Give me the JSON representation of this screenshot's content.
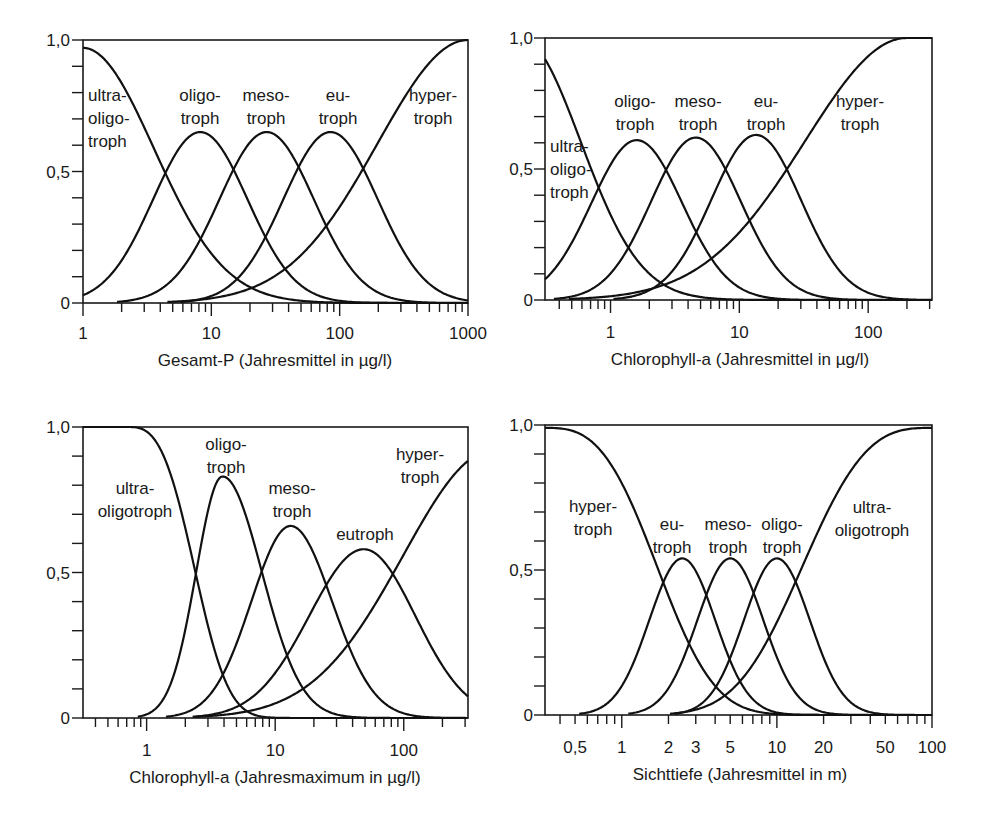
{
  "figure": {
    "colors": {
      "background": "#ffffff",
      "ink": "#111111"
    }
  },
  "chart_data": [
    {
      "id": "tp",
      "type": "line",
      "title": "",
      "xlabel": "Gesamt-P (Jahresmittel in µg/l)",
      "ylabel": "",
      "xscale": "log",
      "xlim": [
        1,
        1000
      ],
      "ylim": [
        0,
        1.0
      ],
      "grid": false,
      "legend": "none (inline labels)",
      "yticks": [
        {
          "v": 0,
          "label": "0"
        },
        {
          "v": 0.5,
          "label": "0,5"
        },
        {
          "v": 1.0,
          "label": "1,0"
        }
      ],
      "xticks": [
        {
          "v": 1,
          "label": "1"
        },
        {
          "v": 10,
          "label": "10"
        },
        {
          "v": 100,
          "label": "100"
        },
        {
          "v": 1000,
          "label": "1000"
        }
      ],
      "layout": {
        "px0": 83,
        "px1": 468,
        "py0": 303,
        "py1": 40,
        "ylab_x": 70,
        "xlab_y": 339,
        "title_x": 275,
        "title_y": 366
      },
      "series": [
        {
          "name": "ultra-oligotroph",
          "peak_x": 1,
          "peak_y": 0.97,
          "cross_half_x": 4.4,
          "model": {
            "mu": 0.0,
            "h": 0.97,
            "wl": 0.65,
            "wr": 0.65,
            "p": 2,
            "clampLeft": true
          }
        },
        {
          "name": "oligotroph",
          "peak_x": 8.2,
          "peak_y": 0.65,
          "model": {
            "mu": 0.914,
            "h": 0.65,
            "wl": 0.433,
            "wr": 0.433,
            "p": 2
          }
        },
        {
          "name": "mesotroph",
          "peak_x": 27,
          "peak_y": 0.65,
          "model": {
            "mu": 1.431,
            "h": 0.65,
            "wl": 0.433,
            "wr": 0.433,
            "p": 2
          }
        },
        {
          "name": "eutroph",
          "peak_x": 85,
          "peak_y": 0.65,
          "model": {
            "mu": 1.929,
            "h": 0.65,
            "wl": 0.433,
            "wr": 0.433,
            "p": 2
          }
        },
        {
          "name": "hypertroph",
          "peak_x": 1000,
          "peak_y": 1.0,
          "cross_half_x": 148,
          "model": {
            "mu": 3.0,
            "h": 1.0,
            "wl": 0.83,
            "wr": 0.83,
            "p": 2
          }
        }
      ],
      "annotations": [
        {
          "lines": [
            "ultra-",
            "oligo-",
            "troph"
          ],
          "x": 88,
          "y": 101,
          "anchor": "start"
        },
        {
          "lines": [
            "oligo-",
            "troph"
          ],
          "x": 200,
          "y": 101,
          "anchor": "middle"
        },
        {
          "lines": [
            "meso-",
            "troph"
          ],
          "x": 266,
          "y": 101,
          "anchor": "middle"
        },
        {
          "lines": [
            "eu-",
            "troph"
          ],
          "x": 338,
          "y": 101,
          "anchor": "middle"
        },
        {
          "lines": [
            "hyper-",
            "troph"
          ],
          "x": 433,
          "y": 101,
          "anchor": "middle"
        }
      ]
    },
    {
      "id": "chla-mean",
      "type": "line",
      "title": "",
      "xlabel": "Chlorophyll-a (Jahresmittel in µg/l)",
      "ylabel": "",
      "xscale": "log",
      "xlim": [
        0.31,
        313
      ],
      "ylim": [
        0,
        1.0
      ],
      "grid": false,
      "legend": "none (inline labels)",
      "yticks": [
        {
          "v": 0,
          "label": "0"
        },
        {
          "v": 0.5,
          "label": "0,5"
        },
        {
          "v": 1.0,
          "label": "1,0"
        }
      ],
      "xticks": [
        {
          "v": 1,
          "label": "1"
        },
        {
          "v": 10,
          "label": "10"
        },
        {
          "v": 100,
          "label": "100"
        }
      ],
      "layout": {
        "px0": 545,
        "px1": 932,
        "py0": 300,
        "py1": 38,
        "ylab_x": 533,
        "xlab_y": 338,
        "title_x": 740,
        "title_y": 365
      },
      "series": [
        {
          "name": "ultra-oligotroph",
          "peak_x": 0.31,
          "peak_y": 0.92,
          "model": {
            "mu": -0.7,
            "h": 1.0,
            "wl": 0.55,
            "wr": 0.55,
            "p": 2
          }
        },
        {
          "name": "oligotroph",
          "peak_x": 1.6,
          "peak_y": 0.61,
          "model": {
            "mu": 0.204,
            "h": 0.61,
            "wl": 0.415,
            "wr": 0.415,
            "p": 2
          }
        },
        {
          "name": "mesotroph",
          "peak_x": 4.6,
          "peak_y": 0.62,
          "model": {
            "mu": 0.663,
            "h": 0.62,
            "wl": 0.41,
            "wr": 0.41,
            "p": 2
          }
        },
        {
          "name": "eutroph",
          "peak_x": 13.5,
          "peak_y": 0.63,
          "model": {
            "mu": 1.13,
            "h": 0.63,
            "wl": 0.41,
            "wr": 0.41,
            "p": 2
          }
        },
        {
          "name": "hypertroph",
          "peak_x": 200,
          "peak_y": 1.0,
          "cross_half_x": 24,
          "model": {
            "mu": 2.3,
            "h": 1.0,
            "wl": 0.93,
            "wr": 0.93,
            "p": 2,
            "clampRight": true
          }
        }
      ],
      "annotations": [
        {
          "lines": [
            "ultra-",
            "oligo-",
            "troph"
          ],
          "x": 550,
          "y": 152,
          "anchor": "start"
        },
        {
          "lines": [
            "oligo-",
            "troph"
          ],
          "x": 635,
          "y": 107,
          "anchor": "middle"
        },
        {
          "lines": [
            "meso-",
            "troph"
          ],
          "x": 698,
          "y": 107,
          "anchor": "middle"
        },
        {
          "lines": [
            "eu-",
            "troph"
          ],
          "x": 766,
          "y": 107,
          "anchor": "middle"
        },
        {
          "lines": [
            "hyper-",
            "troph"
          ],
          "x": 860,
          "y": 107,
          "anchor": "middle"
        }
      ]
    },
    {
      "id": "chla-max",
      "type": "line",
      "title": "",
      "xlabel": "Chlorophyll-a (Jahresmaximum in µg/l)",
      "ylabel": "",
      "xscale": "log",
      "xlim": [
        0.32,
        316
      ],
      "ylim": [
        0,
        1.0
      ],
      "grid": false,
      "legend": "none (inline labels)",
      "yticks": [
        {
          "v": 0,
          "label": "0"
        },
        {
          "v": 0.5,
          "label": "0,5"
        },
        {
          "v": 1.0,
          "label": "1,0"
        }
      ],
      "xticks": [
        {
          "v": 1,
          "label": "1"
        },
        {
          "v": 10,
          "label": "10"
        },
        {
          "v": 100,
          "label": "100"
        }
      ],
      "layout": {
        "px0": 83,
        "px1": 468,
        "py0": 718,
        "py1": 427,
        "ylab_x": 70,
        "xlab_y": 756,
        "title_x": 275,
        "title_y": 783
      },
      "series": [
        {
          "name": "ultra-oligotroph",
          "peak_x": 0.7,
          "peak_y": 1.0,
          "cross_half_x": 2.4,
          "model": {
            "mu": -0.15,
            "h": 1.0,
            "wl": 0.53,
            "wr": 0.53,
            "p": 3,
            "clampLeft": true
          }
        },
        {
          "name": "oligotroph",
          "peak_x": 3.9,
          "peak_y": 0.83,
          "model": {
            "mu": 0.59,
            "h": 0.83,
            "wl": 0.24,
            "wr": 0.36,
            "p": 2
          }
        },
        {
          "name": "mesotroph",
          "peak_x": 13.2,
          "peak_y": 0.66,
          "model": {
            "mu": 1.12,
            "h": 0.66,
            "wl": 0.36,
            "wr": 0.38,
            "p": 2
          }
        },
        {
          "name": "eutroph",
          "peak_x": 49,
          "peak_y": 0.58,
          "model": {
            "mu": 1.69,
            "h": 0.58,
            "wl": 0.5,
            "wr": 0.47,
            "p": 2
          }
        },
        {
          "name": "hypertroph",
          "peak_x": 316,
          "peak_y": 0.89,
          "cross_half_x": 83,
          "model": {
            "mu": 2.7,
            "h": 0.92,
            "wl": 0.83,
            "wr": 0.83,
            "p": 2
          }
        }
      ],
      "annotations": [
        {
          "lines": [
            "ultra-",
            "oligotroph"
          ],
          "x": 135,
          "y": 494,
          "anchor": "middle"
        },
        {
          "lines": [
            "oligo-",
            "troph"
          ],
          "x": 226,
          "y": 450,
          "anchor": "middle"
        },
        {
          "lines": [
            "meso-",
            "troph"
          ],
          "x": 292,
          "y": 494,
          "anchor": "middle"
        },
        {
          "lines": [
            "eutroph"
          ],
          "x": 365,
          "y": 540,
          "anchor": "middle"
        },
        {
          "lines": [
            "hyper-",
            "troph"
          ],
          "x": 420,
          "y": 460,
          "anchor": "middle"
        }
      ]
    },
    {
      "id": "secchi",
      "type": "line",
      "title": "",
      "xlabel": "Sichttiefe (Jahresmittel in m)",
      "ylabel": "",
      "xscale": "log",
      "xlim": [
        0.32,
        100
      ],
      "ylim": [
        0,
        1.0
      ],
      "grid": false,
      "legend": "none (inline labels)",
      "yticks": [
        {
          "v": 0,
          "label": "0"
        },
        {
          "v": 0.5,
          "label": "0,5"
        },
        {
          "v": 1.0,
          "label": "1,0"
        }
      ],
      "xticks": [
        {
          "v": 0.5,
          "label": "0,5"
        },
        {
          "v": 1,
          "label": "1"
        },
        {
          "v": 2,
          "label": "2"
        },
        {
          "v": 3,
          "label": "3"
        },
        {
          "v": 5,
          "label": "5"
        },
        {
          "v": 10,
          "label": "10"
        },
        {
          "v": 20,
          "label": "20"
        },
        {
          "v": 50,
          "label": "50"
        },
        {
          "v": 100,
          "label": "100"
        }
      ],
      "layout": {
        "px0": 545,
        "px1": 932,
        "py0": 715,
        "py1": 425,
        "ylab_x": 533,
        "xlab_y": 753,
        "title_x": 740,
        "title_y": 780
      },
      "series": [
        {
          "name": "hypertroph",
          "peak_x": 0.32,
          "peak_y": 0.98,
          "cross_half_x": 1.7,
          "model": {
            "mu": -0.5,
            "h": 0.99,
            "wl": 0.74,
            "wr": 0.74,
            "p": 3
          }
        },
        {
          "name": "eutroph",
          "peak_x": 2.4,
          "peak_y": 0.54,
          "model": {
            "mu": 0.39,
            "h": 0.54,
            "wl": 0.25,
            "wr": 0.25,
            "p": 2
          }
        },
        {
          "name": "mesotroph",
          "peak_x": 5.0,
          "peak_y": 0.54,
          "model": {
            "mu": 0.7,
            "h": 0.54,
            "wl": 0.25,
            "wr": 0.25,
            "p": 2
          }
        },
        {
          "name": "oligotroph",
          "peak_x": 10,
          "peak_y": 0.54,
          "model": {
            "mu": 1.0,
            "h": 0.54,
            "wl": 0.25,
            "wr": 0.25,
            "p": 2
          }
        },
        {
          "name": "ultra-oligotroph",
          "peak_x": 100,
          "peak_y": 0.98,
          "cross_half_x": 14,
          "model": {
            "mu": 2.0,
            "h": 0.99,
            "wl": 0.85,
            "wr": 0.85,
            "p": 3
          }
        }
      ],
      "annotations": [
        {
          "lines": [
            "hyper-",
            "troph"
          ],
          "x": 593,
          "y": 512,
          "anchor": "middle"
        },
        {
          "lines": [
            "eu-",
            "troph"
          ],
          "x": 672,
          "y": 530,
          "anchor": "middle"
        },
        {
          "lines": [
            "meso-",
            "troph"
          ],
          "x": 728,
          "y": 530,
          "anchor": "middle"
        },
        {
          "lines": [
            "oligo-",
            "troph"
          ],
          "x": 782,
          "y": 530,
          "anchor": "middle"
        },
        {
          "lines": [
            "ultra-",
            "oligotroph"
          ],
          "x": 872,
          "y": 513,
          "anchor": "middle"
        }
      ]
    }
  ]
}
